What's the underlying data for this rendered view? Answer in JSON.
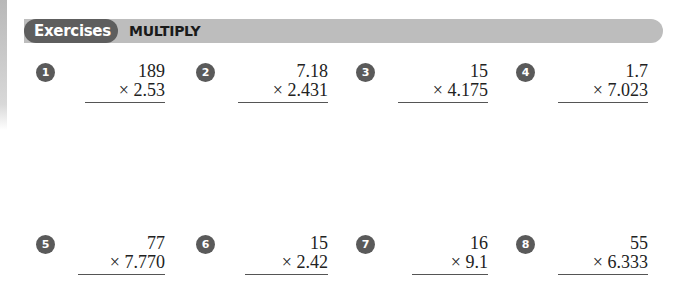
{
  "header": {
    "tag": "Exercises",
    "title": "MULTIPLY"
  },
  "exercises": [
    {
      "number": "1",
      "top": "189",
      "bottom": "× 2.53"
    },
    {
      "number": "2",
      "top": "7.18",
      "bottom": "× 2.431"
    },
    {
      "number": "3",
      "top": "15",
      "bottom": "× 4.175"
    },
    {
      "number": "4",
      "top": "1.7",
      "bottom": "× 7.023"
    },
    {
      "number": "5",
      "top": "77",
      "bottom": "× 7.770"
    },
    {
      "number": "6",
      "top": "15",
      "bottom": "× 2.42"
    },
    {
      "number": "7",
      "top": "16",
      "bottom": "× 9.1"
    },
    {
      "number": "8",
      "top": "55",
      "bottom": "× 6.333"
    }
  ]
}
